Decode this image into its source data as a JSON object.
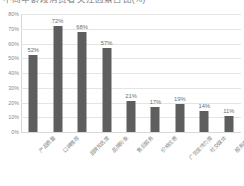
{
  "chart_data": {
    "type": "bar",
    "title": "不同年龄段消费者关注因素占比(%)",
    "xlabel": "",
    "ylabel": "",
    "ylim": [
      0,
      80
    ],
    "ytick_labels": [
      "80%",
      "70%",
      "60%",
      "50%",
      "40%",
      "30%",
      "20%",
      "10%",
      "0%"
    ],
    "ytick_values": [
      80,
      70,
      60,
      50,
      40,
      30,
      20,
      10,
      0
    ],
    "grid": true,
    "legend": false,
    "bar_color": "#5e5e5e",
    "gridline_color": "#e4e4e4",
    "categories": [
      "产品质量",
      "口碑推荐",
      "品牌知名度",
      "品牌形象",
      "售后服务",
      "价格优惠",
      "广告宣传力度",
      "社交媒体",
      "服务态度"
    ],
    "values": [
      52,
      72,
      68,
      57,
      21,
      17,
      19,
      14,
      11
    ],
    "data_labels": [
      "52%",
      "72%",
      "68%",
      "57%",
      "21%",
      "17%",
      "19%",
      "14%",
      "11%"
    ]
  }
}
